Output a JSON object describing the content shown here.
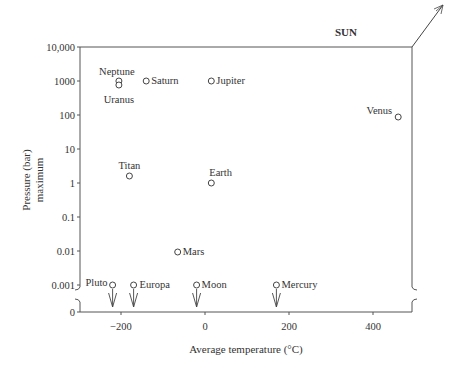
{
  "chart_data": {
    "type": "scatter",
    "title": "",
    "xlabel": "Average temperature (°C)",
    "ylabel": "Pressure (bar) maximum",
    "ylabel_lines": [
      "Pressure (bar)",
      "maximum"
    ],
    "xlim": [
      -300,
      500
    ],
    "x_ticks": [
      -200,
      0,
      200,
      400
    ],
    "x_tick_labels": [
      "−200",
      "0",
      "200",
      "400"
    ],
    "y_scale": "log (broken axis with 0 below break)",
    "y_ticks": [
      10000,
      1000,
      100,
      10,
      1,
      0.1,
      0.01,
      0.001,
      0
    ],
    "y_tick_labels": [
      "10,000",
      "1000",
      "100",
      "10",
      "1",
      "0.1",
      "0.01",
      "0.001",
      "0"
    ],
    "grid": false,
    "legend": null,
    "annotation": "SUN",
    "points": [
      {
        "name": "Neptune",
        "x": -205,
        "y": 1000,
        "upper_limit": false
      },
      {
        "name": "Uranus",
        "x": -200,
        "y": 800,
        "upper_limit": false
      },
      {
        "name": "Saturn",
        "x": -140,
        "y": 1000,
        "upper_limit": false
      },
      {
        "name": "Jupiter",
        "x": 15,
        "y": 1000,
        "upper_limit": false
      },
      {
        "name": "Venus",
        "x": 460,
        "y": 90,
        "upper_limit": false
      },
      {
        "name": "Titan",
        "x": -180,
        "y": 1.5,
        "upper_limit": false
      },
      {
        "name": "Earth",
        "x": 15,
        "y": 1,
        "upper_limit": false
      },
      {
        "name": "Mars",
        "x": -65,
        "y": 0.009,
        "upper_limit": false
      },
      {
        "name": "Pluto",
        "x": -220,
        "y": 0.001,
        "upper_limit": true
      },
      {
        "name": "Europa",
        "x": -170,
        "y": 0.001,
        "upper_limit": true
      },
      {
        "name": "Moon",
        "x": -20,
        "y": 0.001,
        "upper_limit": true
      },
      {
        "name": "Mercury",
        "x": 170,
        "y": 0.001,
        "upper_limit": true
      }
    ]
  }
}
